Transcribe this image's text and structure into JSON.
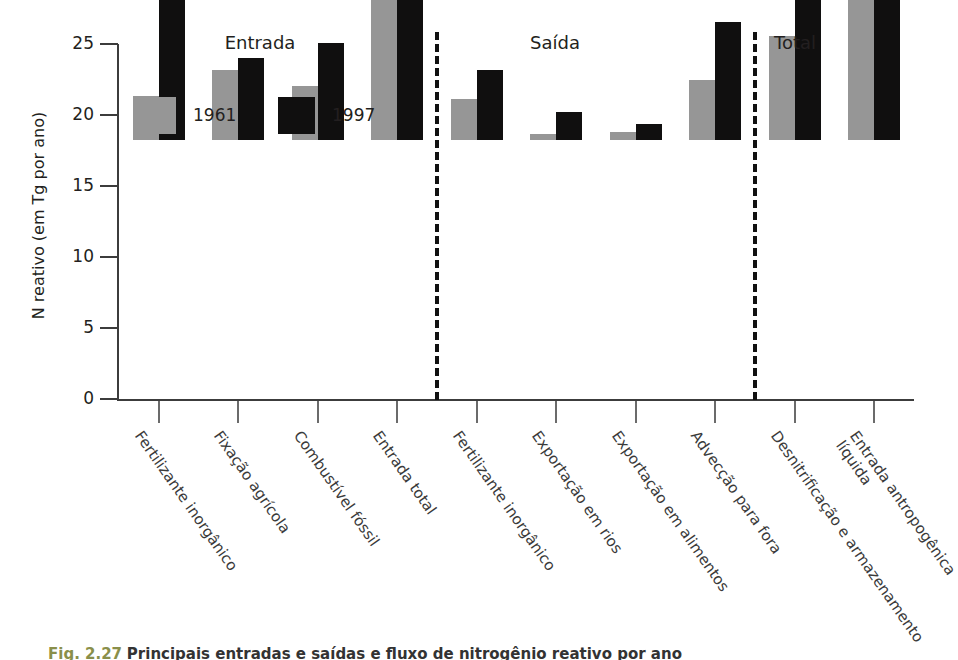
{
  "figure": {
    "caption_fig_no": "Fig. 2.27",
    "caption_text": "Principais entradas e saídas e fluxo de nitrogênio reativo por ano"
  },
  "chart_data": {
    "type": "bar",
    "title": "",
    "xlabel": "",
    "ylabel": "N reativo (em Tg por ano)",
    "ylim": [
      0,
      25
    ],
    "yticks": [
      0,
      5,
      10,
      15,
      20,
      25
    ],
    "grid": false,
    "legend_position": "top-left",
    "categories": [
      "Fertilizante inorgânico",
      "Fixação agrícola",
      "Combustível fóssil",
      "Entrada total",
      "Fertilizante inorgânico",
      "Exportação em rios",
      "Exportação em alimentos",
      "Advecção para fora",
      "Desnitrificação e armazenamento",
      "Entrada antropogênica líquida"
    ],
    "series": [
      {
        "name": "1961",
        "color": "#969696",
        "values": [
          3.1,
          4.9,
          3.8,
          11.7,
          2.9,
          0.45,
          0.55,
          4.2,
          7.3,
          10.3
        ]
      },
      {
        "name": "1997",
        "color": "#100f0f",
        "values": [
          11.2,
          5.8,
          6.8,
          23.9,
          4.9,
          2.0,
          1.1,
          8.3,
          15.3,
          20.3
        ]
      }
    ],
    "sections": [
      {
        "label": "Entrada",
        "categories": [
          0,
          1,
          2,
          3
        ]
      },
      {
        "label": "Saída",
        "categories": [
          4,
          5,
          6,
          7
        ]
      },
      {
        "label": "Total",
        "categories": [
          8,
          9
        ]
      }
    ]
  },
  "axis": {
    "tick_labels": [
      "25",
      "20",
      "15",
      "10",
      "5",
      "0"
    ]
  },
  "legend": {
    "entries": [
      {
        "label": "1961",
        "swatch": "gray"
      },
      {
        "label": "1997",
        "swatch": "black"
      }
    ]
  },
  "sections": {
    "entrada": "Entrada",
    "saida": "Saída",
    "total": "Total"
  },
  "category_labels": [
    "Fertilizante inorgânico",
    "Fixação agrícola",
    "Combustível fóssil",
    "Entrada total",
    "Fertilizante inorgânico",
    "Exportação em rios",
    "Exportação em alimentos",
    "Advecção para fora",
    "Desnitrificação e armazenamento",
    "Entrada antropogênica líquida"
  ]
}
